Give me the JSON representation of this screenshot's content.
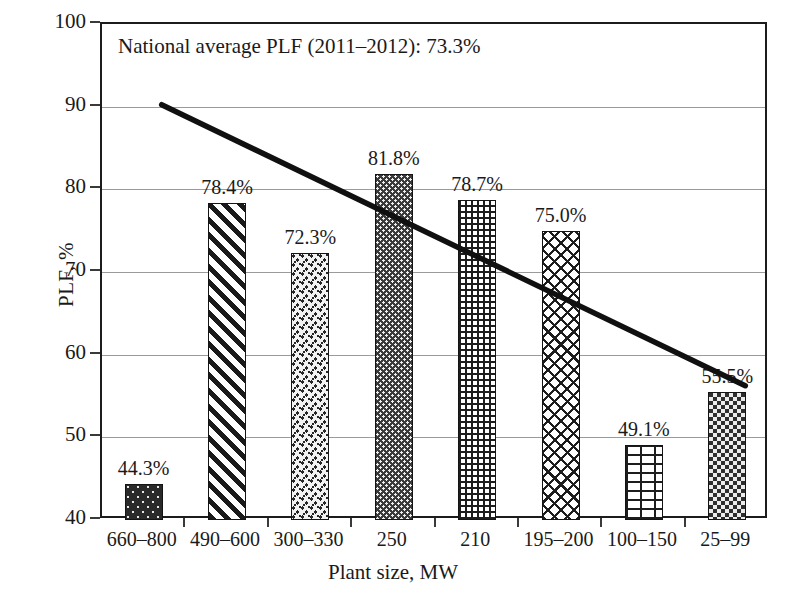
{
  "chart_data": {
    "type": "bar",
    "title": "",
    "subtitle": "",
    "xlabel": "Plant size, MW",
    "ylabel": "PLF, %",
    "categories": [
      "660–800",
      "490–600",
      "300–330",
      "250",
      "210",
      "195–200",
      "100–150",
      "25–99"
    ],
    "values": [
      44.3,
      78.4,
      72.3,
      81.8,
      78.7,
      75.0,
      49.1,
      55.5
    ],
    "value_labels": [
      "44.3%",
      "78.4%",
      "72.3%",
      "81.8%",
      "78.7%",
      "75.0%",
      "49.1%",
      "55.5%"
    ],
    "bar_patterns": [
      "dots-dark",
      "diagonal-stripes",
      "speckle",
      "dense-dot",
      "grid",
      "weave",
      "brick",
      "checker"
    ],
    "ylim": [
      40,
      100
    ],
    "yticks": [
      40,
      50,
      60,
      70,
      80,
      90,
      100
    ],
    "ytick_labels": [
      "40",
      "50",
      "60",
      "70",
      "80",
      "90",
      "100"
    ],
    "grid": true,
    "legend": "none",
    "annotations": [
      {
        "name": "national-average-note",
        "text": "National average PLF (2011–2012): 73.3%",
        "value": 73.3
      }
    ],
    "series": [
      {
        "name": "PLF by plant size",
        "type": "bar",
        "values": [
          44.3,
          78.4,
          72.3,
          81.8,
          78.7,
          75.0,
          49.1,
          55.5
        ]
      },
      {
        "name": "trend line",
        "type": "line",
        "start_value": 90.0,
        "end_value": 56.0,
        "x_start_category": "660–800",
        "x_end_category": "25–99"
      }
    ],
    "colors": {
      "axis": "#1c1c1c",
      "grid": "#9a9a9a",
      "trend_line": "#101010",
      "text": "#1a1a1a",
      "background": "#ffffff"
    }
  }
}
